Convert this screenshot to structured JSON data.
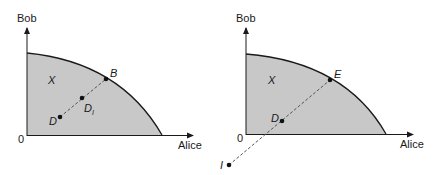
{
  "colors": {
    "region_fill": "#c8c8c8",
    "frontier_stroke": "#1a1a1a",
    "axis_stroke": "#1a1a1a",
    "dash_stroke": "#555555",
    "point_fill": "#111111"
  },
  "panels": [
    {
      "id": "left",
      "y_axis_label": "Bob",
      "x_axis_label": "Alice",
      "origin_label": "0",
      "region_label": "X",
      "points": [
        {
          "name": "B",
          "label": "B"
        },
        {
          "name": "D1",
          "label": "D",
          "subscript": "I"
        },
        {
          "name": "D",
          "label": "D"
        }
      ]
    },
    {
      "id": "right",
      "y_axis_label": "Bob",
      "x_axis_label": "Alice",
      "origin_label": "0",
      "region_label": "X",
      "points": [
        {
          "name": "E",
          "label": "E"
        },
        {
          "name": "D",
          "label": "D"
        },
        {
          "name": "I",
          "label": "I"
        }
      ]
    }
  ]
}
